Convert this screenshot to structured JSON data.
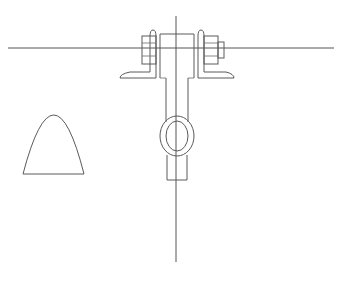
{
  "drawing": {
    "type": "mechanical-line-drawing",
    "subject": "clevis bracket assembly with bolts",
    "colors": {
      "background": "#ffffff",
      "line": "#5a5a5a"
    },
    "components": [
      {
        "name": "horizontal-centerline",
        "y": 48
      },
      {
        "name": "vertical-centerline",
        "x": 176
      },
      {
        "name": "left-angle-bracket"
      },
      {
        "name": "right-angle-bracket"
      },
      {
        "name": "left-bolt-head"
      },
      {
        "name": "right-nut-and-bolt"
      },
      {
        "name": "central-clevis-body"
      },
      {
        "name": "eye-ring-outer"
      },
      {
        "name": "eye-ring-inner"
      },
      {
        "name": "lower-shank"
      },
      {
        "name": "parabolic-profile"
      }
    ]
  }
}
